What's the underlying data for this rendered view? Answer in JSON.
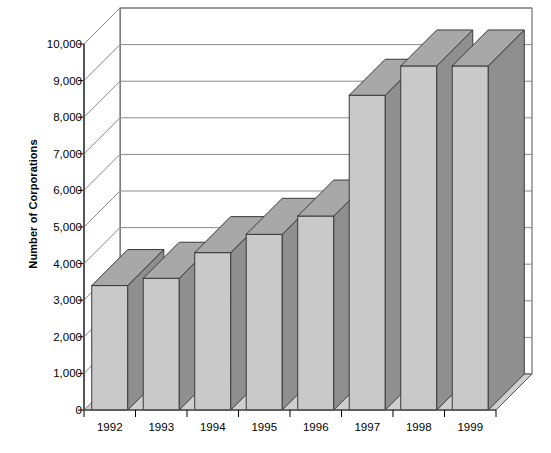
{
  "chart_data": {
    "type": "bar",
    "title": "",
    "subtitle": "",
    "xlabel": "",
    "ylabel": "Number of Corporations",
    "categories": [
      "1992",
      "1993",
      "1994",
      "1995",
      "1996",
      "1997",
      "1998",
      "1999"
    ],
    "values": [
      3400,
      3600,
      4300,
      4800,
      5300,
      8600,
      9400,
      9400
    ],
    "series": [
      {
        "name": "Number of Corporations",
        "values": [
          3400,
          3600,
          4300,
          4800,
          5300,
          8600,
          9400,
          9400
        ]
      }
    ],
    "ylim": [
      0,
      10000
    ],
    "ytick_values": [
      0,
      1000,
      2000,
      3000,
      4000,
      5000,
      6000,
      7000,
      8000,
      9000,
      10000
    ],
    "ytick_labels": [
      "0",
      "1,000",
      "2,000",
      "3,000",
      "4,000",
      "5,000",
      "6,000",
      "7,000",
      "8,000",
      "9,000",
      "10,000"
    ],
    "grid": true,
    "grid_axis": "y",
    "legend": false,
    "legend_position": "none",
    "style": "3d-column",
    "colors": {
      "bar_front": "#c9c9c9",
      "bar_side": "#8f8f8f",
      "bar_top": "#a8a8a8",
      "bar_outline": "#3a3a3a",
      "grid_line": "#8a8a8a",
      "axis_line": "#555555",
      "floor": "#cfcfcf",
      "background": "#ffffff",
      "text": "#000000"
    }
  },
  "axis": {
    "y_title": "Number of Corporations"
  }
}
